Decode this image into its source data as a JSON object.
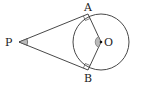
{
  "diagram": {
    "type": "geometry",
    "labels": {
      "P": "P",
      "A": "A",
      "B": "B",
      "O": "O"
    },
    "points": {
      "P": [
        19,
        42
      ],
      "A": [
        88,
        14
      ],
      "B": [
        88,
        70
      ],
      "O": [
        101,
        42
      ]
    },
    "circle": {
      "center": "O",
      "radius": 28
    },
    "marks": {
      "right_angle_at_A": true,
      "right_angle_at_B": true,
      "angle_P_marked": true,
      "angle_AOB_marked": true
    },
    "colors": {
      "stroke": "#333333",
      "angle_fill": "#bbbbbb"
    }
  }
}
